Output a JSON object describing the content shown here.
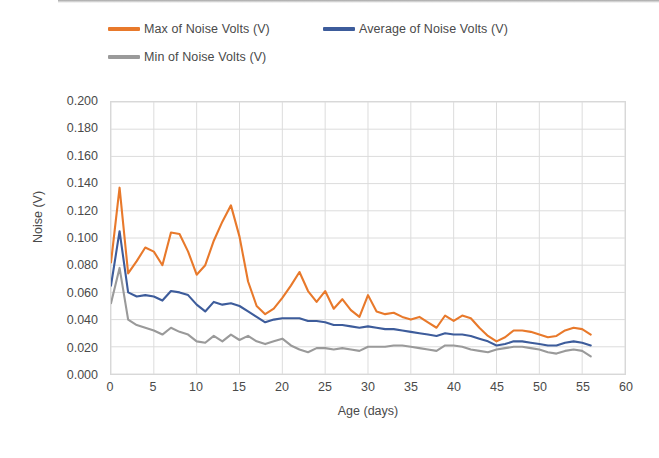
{
  "legend": {
    "items": [
      {
        "label": "Max of Noise Volts (V)",
        "color": "#E8792B",
        "key": "max"
      },
      {
        "label": "Average of Noise Volts (V)",
        "color": "#3D5C9B",
        "key": "avg"
      },
      {
        "label": "Min of Noise Volts (V)",
        "color": "#9A9A9A",
        "key": "min"
      }
    ]
  },
  "axes": {
    "y_title": "Noise (V)",
    "x_title": "Age (days)",
    "y_ticks": [
      "0.000",
      "0.020",
      "0.040",
      "0.060",
      "0.080",
      "0.100",
      "0.120",
      "0.140",
      "0.160",
      "0.180",
      "0.200"
    ],
    "x_ticks": [
      "0",
      "5",
      "10",
      "15",
      "20",
      "25",
      "30",
      "35",
      "40",
      "45",
      "50",
      "55",
      "60"
    ]
  },
  "chart_data": {
    "type": "line",
    "title": "",
    "xlabel": "Age (days)",
    "ylabel": "Noise (V)",
    "xlim": [
      0,
      60
    ],
    "ylim": [
      0,
      0.2
    ],
    "ytick_step": 0.02,
    "xtick_step": 5,
    "grid": true,
    "legend_position": "top",
    "x": [
      0,
      1,
      2,
      3,
      4,
      5,
      6,
      7,
      8,
      9,
      10,
      11,
      12,
      13,
      14,
      15,
      16,
      17,
      18,
      19,
      20,
      21,
      22,
      23,
      24,
      25,
      26,
      27,
      28,
      29,
      30,
      31,
      32,
      33,
      34,
      35,
      36,
      37,
      38,
      39,
      40,
      41,
      42,
      43,
      44,
      45,
      46,
      47,
      48,
      49,
      50,
      51,
      52,
      53,
      54,
      55,
      56
    ],
    "series": [
      {
        "name": "Max of Noise Volts (V)",
        "key": "max",
        "color": "#E8792B",
        "values": [
          0.082,
          0.137,
          0.074,
          0.083,
          0.093,
          0.09,
          0.08,
          0.104,
          0.103,
          0.09,
          0.073,
          0.08,
          0.098,
          0.112,
          0.124,
          0.101,
          0.068,
          0.05,
          0.044,
          0.048,
          0.056,
          0.065,
          0.075,
          0.061,
          0.053,
          0.061,
          0.048,
          0.055,
          0.047,
          0.042,
          0.058,
          0.046,
          0.044,
          0.045,
          0.042,
          0.04,
          0.042,
          0.038,
          0.034,
          0.043,
          0.039,
          0.043,
          0.041,
          0.034,
          0.028,
          0.024,
          0.027,
          0.032,
          0.032,
          0.031,
          0.029,
          0.027,
          0.028,
          0.032,
          0.034,
          0.033,
          0.029
        ]
      },
      {
        "name": "Average of Noise Volts (V)",
        "key": "avg",
        "color": "#3D5C9B",
        "values": [
          0.065,
          0.105,
          0.06,
          0.057,
          0.058,
          0.057,
          0.054,
          0.061,
          0.06,
          0.058,
          0.051,
          0.046,
          0.053,
          0.051,
          0.052,
          0.05,
          0.046,
          0.042,
          0.038,
          0.04,
          0.041,
          0.041,
          0.041,
          0.039,
          0.039,
          0.038,
          0.036,
          0.036,
          0.035,
          0.034,
          0.035,
          0.034,
          0.033,
          0.033,
          0.032,
          0.031,
          0.03,
          0.029,
          0.028,
          0.03,
          0.029,
          0.029,
          0.028,
          0.026,
          0.024,
          0.021,
          0.022,
          0.024,
          0.024,
          0.023,
          0.022,
          0.021,
          0.021,
          0.023,
          0.024,
          0.023,
          0.021
        ]
      },
      {
        "name": "Min of Noise Volts (V)",
        "key": "min",
        "color": "#9A9A9A",
        "values": [
          0.052,
          0.078,
          0.04,
          0.036,
          0.034,
          0.032,
          0.029,
          0.034,
          0.031,
          0.029,
          0.024,
          0.023,
          0.028,
          0.024,
          0.029,
          0.025,
          0.028,
          0.024,
          0.022,
          0.024,
          0.026,
          0.021,
          0.018,
          0.016,
          0.019,
          0.019,
          0.018,
          0.019,
          0.018,
          0.017,
          0.02,
          0.02,
          0.02,
          0.021,
          0.021,
          0.02,
          0.019,
          0.018,
          0.017,
          0.021,
          0.021,
          0.02,
          0.018,
          0.017,
          0.016,
          0.018,
          0.019,
          0.02,
          0.02,
          0.019,
          0.018,
          0.016,
          0.015,
          0.017,
          0.018,
          0.017,
          0.013
        ]
      }
    ]
  }
}
